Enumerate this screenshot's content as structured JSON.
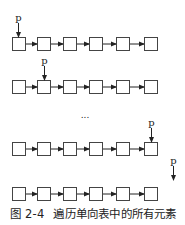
{
  "figure": {
    "pointer_label": "p",
    "ellipsis": "...",
    "caption_number": "图 2-4",
    "caption_text": "遍历单向表中的所有元素",
    "node_count": 6,
    "rows": [
      {
        "y": 37,
        "pointer_index": 0,
        "pointer_x": 18,
        "label_y": 21
      },
      {
        "y": 80,
        "pointer_index": 1,
        "pointer_x": 44,
        "label_y": 64
      },
      {
        "y": 142,
        "pointer_index": 5,
        "pointer_x": 151,
        "label_y": 126
      },
      {
        "y": 187,
        "pointer_index": -1,
        "pointer_x": 173,
        "label_y": 164
      }
    ],
    "node_x": [
      12,
      37,
      63,
      89,
      116,
      144
    ],
    "colors": {
      "stroke": "#444444",
      "text": "#222222"
    }
  }
}
